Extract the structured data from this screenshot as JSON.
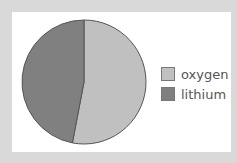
{
  "chart_data": {
    "type": "pie",
    "title": "",
    "categories": [
      "oxygen",
      "lithium"
    ],
    "values": [
      53,
      47
    ],
    "colors": [
      "#c0c0c0",
      "#808080"
    ],
    "legend_position": "right",
    "start_angle": "top, clockwise"
  },
  "legend": {
    "items": [
      {
        "label": "oxygen",
        "color": "#c0c0c0"
      },
      {
        "label": "lithium",
        "color": "#808080"
      }
    ]
  }
}
